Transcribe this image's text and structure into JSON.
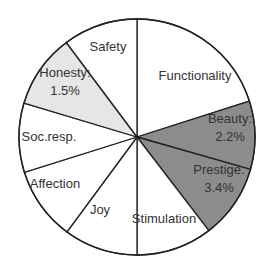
{
  "chart_data": {
    "type": "pie",
    "title": "",
    "start_angle_deg": 0,
    "direction": "clockwise",
    "colors": {
      "default": "#ffffff",
      "dark": "#8c8c8c",
      "light": "#e6e6e6",
      "stroke": "#222222"
    },
    "slices": [
      {
        "name": "Functionality",
        "label": "Functionality",
        "value_label": "",
        "start": 0,
        "end": 72.3,
        "fill": "#ffffff",
        "lx": 195,
        "ly": 80
      },
      {
        "name": "Beauty",
        "label": "Beauty:",
        "value_label": "2.2%",
        "start": 72.3,
        "end": 105.9,
        "fill": "#8c8c8c",
        "lx": 230,
        "ly": 131
      },
      {
        "name": "Prestige",
        "label": "Prestige:",
        "value_label": "3.4%",
        "start": 105.9,
        "end": 142.5,
        "fill": "#8c8c8c",
        "lx": 219,
        "ly": 182
      },
      {
        "name": "Stimulation",
        "label": "Stimulation",
        "value_label": "",
        "start": 142.5,
        "end": 180,
        "fill": "#ffffff",
        "lx": 164,
        "ly": 223
      },
      {
        "name": "Joy",
        "label": "Joy",
        "value_label": "",
        "start": 180,
        "end": 216.4,
        "fill": "#ffffff",
        "lx": 100,
        "ly": 214
      },
      {
        "name": "Affection",
        "label": "Affection",
        "value_label": "",
        "start": 216.4,
        "end": 252.6,
        "fill": "#ffffff",
        "lx": 55,
        "ly": 188
      },
      {
        "name": "Soc.resp.",
        "label": "Soc.resp.",
        "value_label": "",
        "start": 252.6,
        "end": 286.7,
        "fill": "#ffffff",
        "lx": 49,
        "ly": 141
      },
      {
        "name": "Honesty",
        "label": "Honesty:",
        "value_label": "1.5%",
        "start": 286.7,
        "end": 323.2,
        "fill": "#e6e6e6",
        "lx": 65,
        "ly": 85
      },
      {
        "name": "Safety",
        "label": "Safety",
        "value_label": "",
        "start": 323.2,
        "end": 360,
        "fill": "#ffffff",
        "lx": 108,
        "ly": 51
      }
    ],
    "visible_percentages": {
      "Beauty": 2.2,
      "Prestige": 3.4,
      "Honesty": 1.5
    },
    "legend": "none",
    "center": [
      137,
      137
    ],
    "radius": 118
  }
}
